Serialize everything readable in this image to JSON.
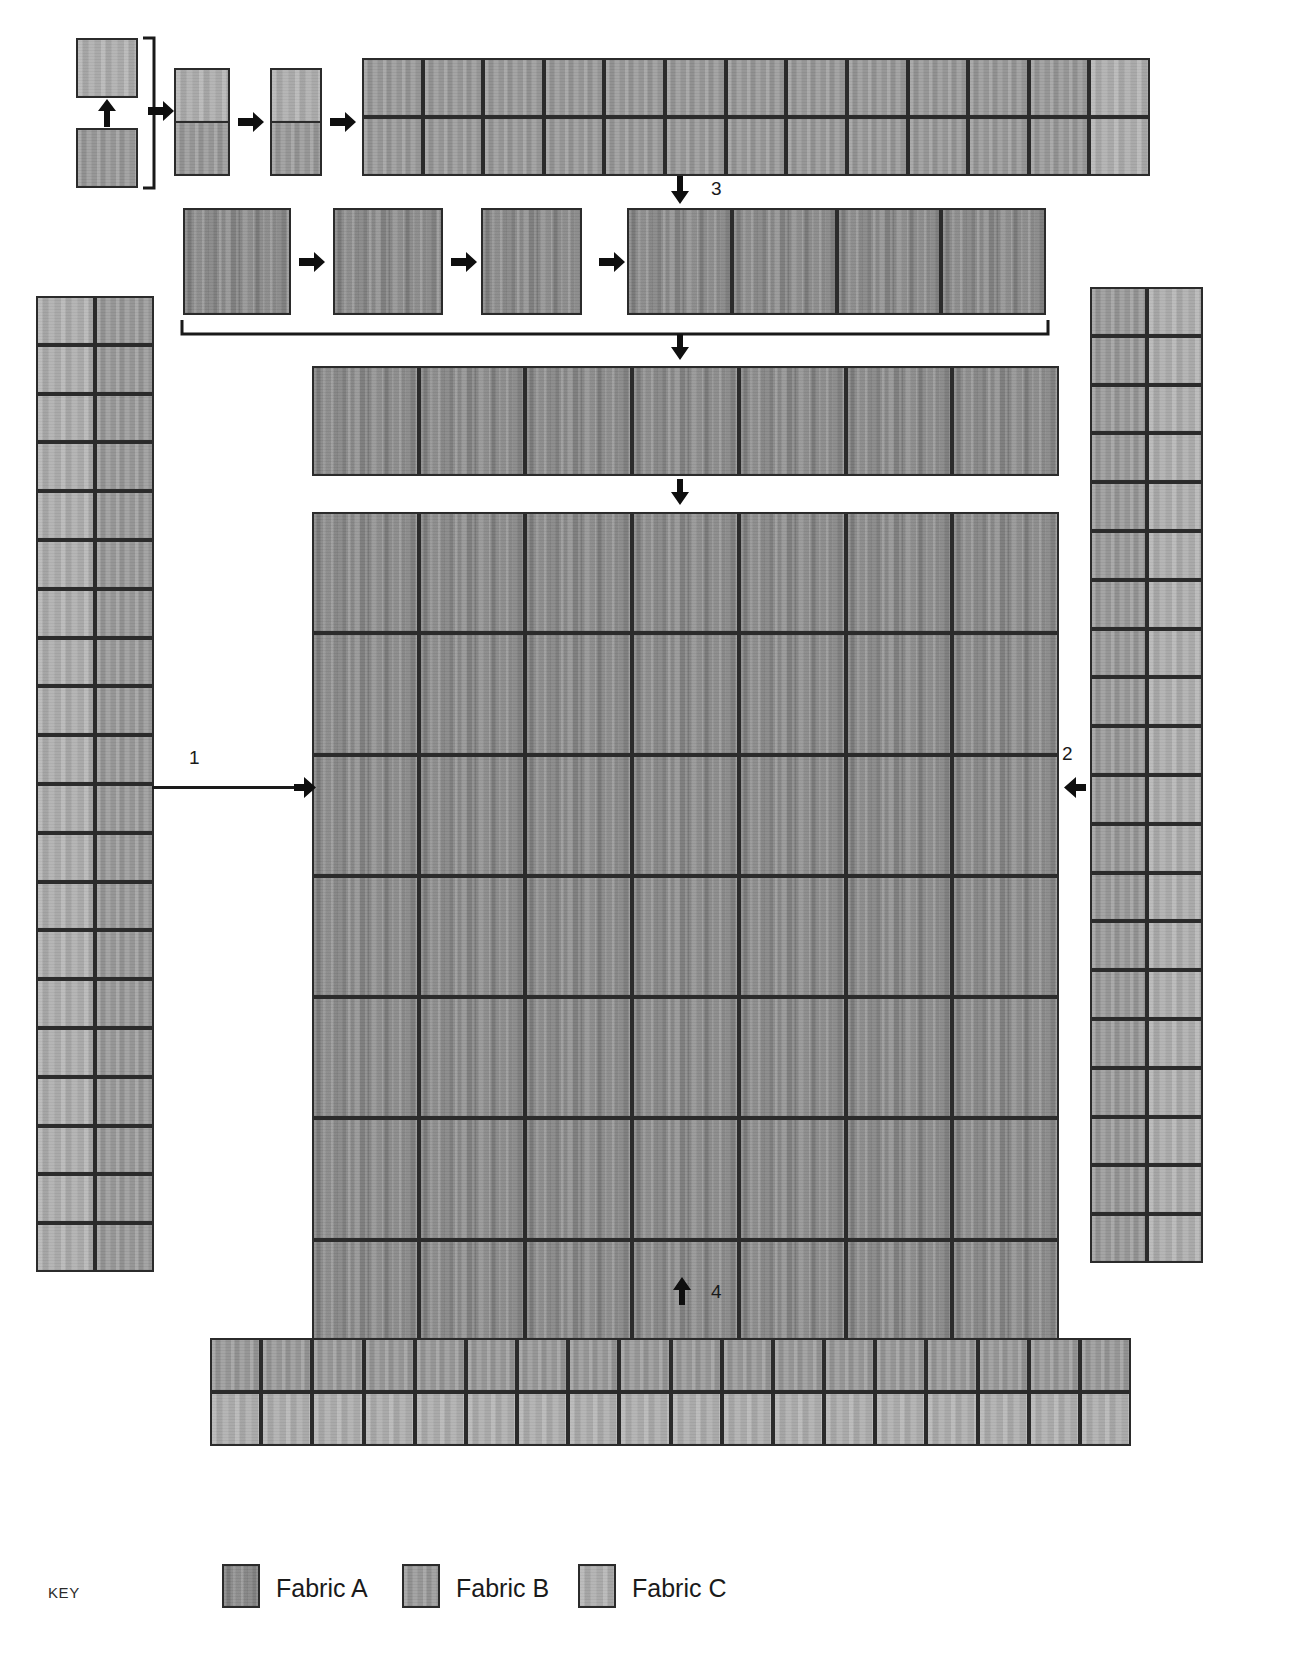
{
  "diagram": {
    "steps": [
      {
        "id": "1",
        "label": "1",
        "direction": "right"
      },
      {
        "id": "2",
        "label": "2",
        "direction": "left"
      },
      {
        "id": "3",
        "label": "3",
        "direction": "down"
      },
      {
        "id": "4",
        "label": "4",
        "direction": "up"
      }
    ]
  },
  "legend": {
    "key_label": "KEY",
    "items": [
      {
        "name": "Fabric A",
        "swatch": "fa",
        "color": "#8e8e8e"
      },
      {
        "name": "Fabric B",
        "swatch": "fb",
        "color": "#9b9b9b"
      },
      {
        "name": "Fabric C",
        "swatch": "fc",
        "color": "#adadad"
      }
    ]
  },
  "row1": {
    "description": "Two squares joined into a two-patch unit, repeated across a long strip",
    "source_squares": [
      {
        "fabric": "fc"
      },
      {
        "fabric": "fb"
      }
    ],
    "join_arrow": "up-arrow",
    "units": [
      {
        "top": "fc",
        "bottom": "fb"
      },
      {
        "top": "fc",
        "bottom": "fb"
      }
    ],
    "strip_cell_count": 13,
    "strip_cells": [
      {
        "top": "fb",
        "bottom": "fb"
      },
      {
        "top": "fb",
        "bottom": "fb"
      },
      {
        "top": "fb",
        "bottom": "fb"
      },
      {
        "top": "fb",
        "bottom": "fb"
      },
      {
        "top": "fb",
        "bottom": "fb"
      },
      {
        "top": "fb",
        "bottom": "fb"
      },
      {
        "top": "fb",
        "bottom": "fb"
      },
      {
        "top": "fb",
        "bottom": "fb"
      },
      {
        "top": "fb",
        "bottom": "fb"
      },
      {
        "top": "fb",
        "bottom": "fb"
      },
      {
        "top": "fb",
        "bottom": "fb"
      },
      {
        "top": "fb",
        "bottom": "fb"
      },
      {
        "top": "fc",
        "bottom": "fc"
      }
    ]
  },
  "row2": {
    "description": "Three Fabric A squares progress to a four-block row",
    "squares": [
      {
        "fabric": "fa"
      },
      {
        "fabric": "fa"
      },
      {
        "fabric": "fa"
      }
    ],
    "result_cell_count": 4,
    "result_cells": [
      {
        "fabric": "fa"
      },
      {
        "fabric": "fa"
      },
      {
        "fabric": "fa"
      },
      {
        "fabric": "fa"
      }
    ]
  },
  "row3": {
    "description": "Seven Fabric A blocks forming the top row of the quilt center",
    "cell_count": 7,
    "cells": [
      {
        "fabric": "fa"
      },
      {
        "fabric": "fa"
      },
      {
        "fabric": "fa"
      },
      {
        "fabric": "fa"
      },
      {
        "fabric": "fa"
      },
      {
        "fabric": "fa"
      },
      {
        "fabric": "fa"
      }
    ]
  },
  "quilt_center": {
    "description": "Main quilt body, seven columns by seven rows of Fabric A blocks",
    "columns": 7,
    "rows": 7,
    "fabric": "fa"
  },
  "left_border": {
    "description": "Left pieced border, two columns wide",
    "columns": 2,
    "rows": 20,
    "column_fabrics": [
      "fc",
      "fb"
    ]
  },
  "right_border": {
    "description": "Right pieced border, two columns wide",
    "columns": 2,
    "rows": 20,
    "column_fabrics": [
      "fb",
      "fc"
    ]
  },
  "bottom_border": {
    "description": "Bottom pieced border, two rows tall",
    "columns": 18,
    "rows": 2,
    "row_fabrics": [
      "fb",
      "fc"
    ]
  }
}
